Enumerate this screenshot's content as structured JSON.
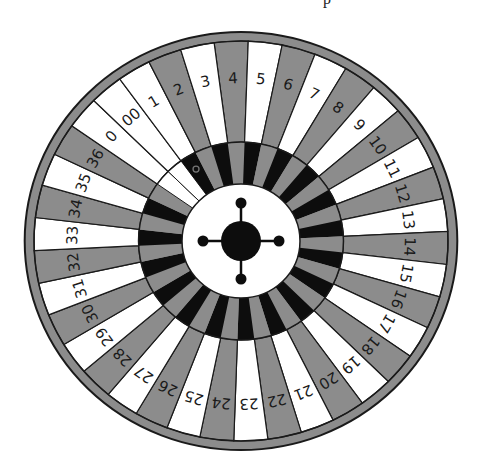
{
  "figure": {
    "type": "roulette-wheel",
    "top_fragment_text": "p",
    "colors": {
      "gray": "#8c8c8c",
      "white": "#ffffff",
      "black": "#0d0d0d",
      "outline": "#1a1a1a",
      "background": "#ffffff"
    },
    "geometry": {
      "cx": 241,
      "cy": 241,
      "scale_x": 1.035,
      "scale_y": 1.0,
      "rim_outer_r": 209,
      "rim_inner_r": 200,
      "number_ring_inner_r": 99,
      "pocket_ring_inner_r": 57,
      "label_r": 163,
      "hub_r": 57,
      "center_disc_r": 20,
      "knob_distance": 38,
      "knob_r": 5.5,
      "start_angle_deg": -7.47
    },
    "sectors_clockwise_from_top": [
      {
        "label": "4",
        "color": "gray"
      },
      {
        "label": "5",
        "color": "white"
      },
      {
        "label": "6",
        "color": "gray"
      },
      {
        "label": "7",
        "color": "white"
      },
      {
        "label": "8",
        "color": "gray"
      },
      {
        "label": "9",
        "color": "white"
      },
      {
        "label": "10",
        "color": "gray"
      },
      {
        "label": "11",
        "color": "white"
      },
      {
        "label": "12",
        "color": "gray"
      },
      {
        "label": "13",
        "color": "white"
      },
      {
        "label": "14",
        "color": "gray"
      },
      {
        "label": "15",
        "color": "white"
      },
      {
        "label": "16",
        "color": "gray"
      },
      {
        "label": "17",
        "color": "white"
      },
      {
        "label": "18",
        "color": "gray"
      },
      {
        "label": "19",
        "color": "white"
      },
      {
        "label": "20",
        "color": "gray"
      },
      {
        "label": "21",
        "color": "white"
      },
      {
        "label": "22",
        "color": "gray"
      },
      {
        "label": "23",
        "color": "white"
      },
      {
        "label": "24",
        "color": "gray"
      },
      {
        "label": "25",
        "color": "white"
      },
      {
        "label": "26",
        "color": "gray"
      },
      {
        "label": "27",
        "color": "white"
      },
      {
        "label": "28",
        "color": "gray"
      },
      {
        "label": "29",
        "color": "white"
      },
      {
        "label": "30",
        "color": "gray"
      },
      {
        "label": "31",
        "color": "white"
      },
      {
        "label": "32",
        "color": "gray"
      },
      {
        "label": "33",
        "color": "white"
      },
      {
        "label": "34",
        "color": "gray"
      },
      {
        "label": "35",
        "color": "white"
      },
      {
        "label": "36",
        "color": "gray"
      },
      {
        "label": "0",
        "color": "white",
        "pocket": "white"
      },
      {
        "label": "00",
        "color": "white",
        "pocket": "white"
      },
      {
        "label": "1",
        "color": "white",
        "ball": true
      },
      {
        "label": "2",
        "color": "gray"
      },
      {
        "label": "3",
        "color": "white"
      }
    ]
  }
}
